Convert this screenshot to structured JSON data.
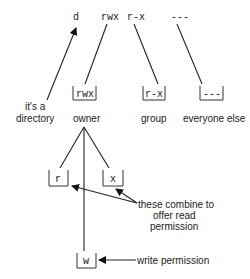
{
  "top_row": {
    "type_char": "d",
    "owner_perms": "rwx",
    "group_perms": "r-x",
    "other_perms": "---"
  },
  "boxes": {
    "owner": "rwx",
    "group": "r-x",
    "other": "---"
  },
  "labels": {
    "directory_line1": "it's a",
    "directory_line2": "directory",
    "owner": "owner",
    "group": "group",
    "other": "everyone else"
  },
  "owner_breakdown": {
    "read": "r",
    "execute": "x",
    "write": "w"
  },
  "annotations": {
    "combine_line1": "these combine to",
    "combine_line2": "offer read",
    "combine_line3": "permission",
    "write": "write permission"
  }
}
